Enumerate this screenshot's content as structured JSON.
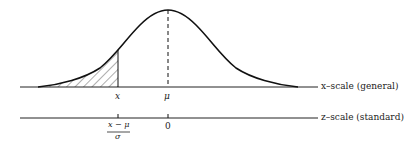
{
  "diagram": {
    "x_scale_label": "x–scale (general)",
    "z_scale_label": "z–scale (standard)",
    "x_tick_label": "x",
    "mu_tick_label": "μ",
    "z_zero_label": "0",
    "z_fraction_numerator": "x − μ",
    "z_fraction_denominator": "σ",
    "shaded_region": "area under normal curve left of x"
  }
}
